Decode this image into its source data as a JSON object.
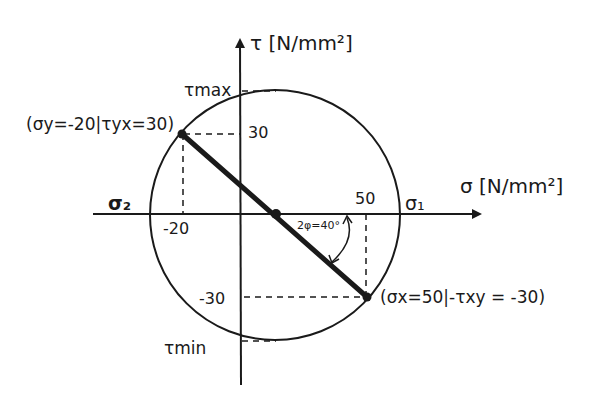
{
  "diagram": {
    "type": "Mohr's circle",
    "axes": {
      "tau_label": "τ [N/mm²]",
      "sigma_label": "σ [N/mm²]"
    },
    "labels": {
      "tau_max": "τmax",
      "tau_min": "τmin",
      "sigma_1": "σ₁",
      "sigma_2": "σ₂",
      "tick_30": "30",
      "tick_neg30": "-30",
      "tick_neg20": "-20",
      "tick_50": "50",
      "angle": "2φ=40°"
    },
    "points": {
      "upper": "(σy=-20|τyx=30)",
      "lower": "(σx=50|-τxy = -30)"
    },
    "values": {
      "sigma_x": 50,
      "sigma_y": -20,
      "tau_xy": -30,
      "tau_yx": 30,
      "two_phi_deg": 40
    },
    "colors": {
      "ink": "#1a1a1a",
      "background": "#ffffff"
    }
  }
}
